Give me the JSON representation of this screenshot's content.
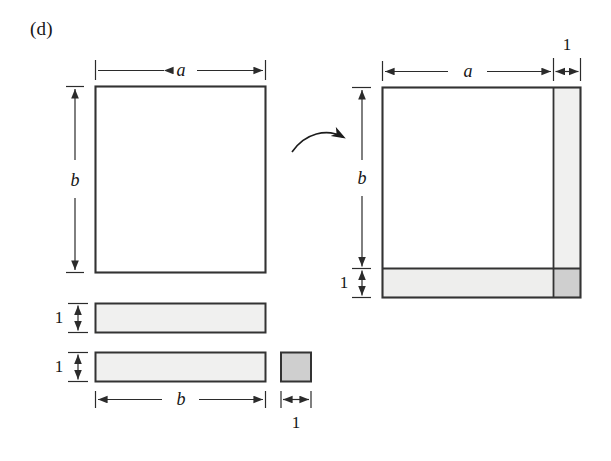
{
  "figure": {
    "panel_label": "(d)",
    "colors": {
      "ink": "#2b2b2b",
      "stroke": "#333333",
      "page_background": "#ffffff",
      "fill_white": "#ffffff",
      "fill_light_gray": "#f0f0ef",
      "fill_medium_gray": "#cfcfcf"
    },
    "left_group": {
      "name": "pieces-before-assembly",
      "main_rectangle": {
        "name": "rectangle-a-by-b",
        "width_label": "a",
        "height_label": "b",
        "fill": "white"
      },
      "strip_top": {
        "name": "horizontal-strip-1",
        "height_label": "1",
        "width_label": "b",
        "fill": "light-gray"
      },
      "strip_bottom": {
        "name": "horizontal-strip-2",
        "height_label": "1",
        "width_label": "b",
        "fill": "light-gray"
      },
      "unit_square": {
        "name": "unit-square",
        "width_label": "1",
        "height_label": "1",
        "fill": "medium-gray"
      }
    },
    "arrow": {
      "name": "transformation-arrow",
      "direction": "right",
      "style": "curved"
    },
    "right_group": {
      "name": "assembled-figure",
      "outer": {
        "name": "assembled-rectangle",
        "width_labels": [
          "a",
          "1"
        ],
        "height_labels": [
          "b",
          "1"
        ]
      },
      "core": {
        "name": "core-region-a-by-b",
        "fill": "white"
      },
      "right_strip": {
        "name": "vertical-strip-right",
        "width_label": "1",
        "height_label": "b",
        "fill": "light-gray"
      },
      "bottom_strip": {
        "name": "horizontal-strip-bottom",
        "width_label": "a",
        "height_label": "1",
        "fill": "light-gray"
      },
      "corner_square": {
        "name": "corner-unit-square",
        "width_label": "1",
        "height_label": "1",
        "fill": "medium-gray"
      }
    },
    "labels": {
      "left_top_a": "a",
      "left_side_b": "b",
      "left_strip1_height": "1",
      "left_strip2_height": "1",
      "left_bottom_b": "b",
      "left_bottom_1": "1",
      "right_top_a": "a",
      "right_top_1": "1",
      "right_side_b": "b",
      "right_side_1": "1"
    }
  }
}
